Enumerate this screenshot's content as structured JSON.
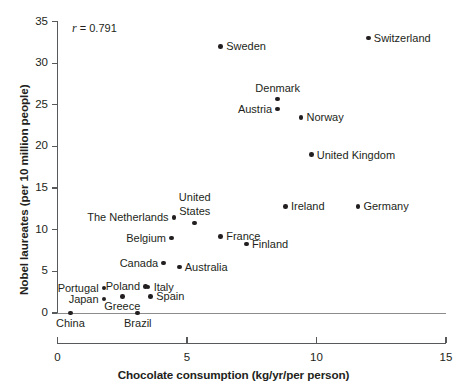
{
  "chart_data": {
    "type": "scatter",
    "title": "",
    "xlabel": "Chocolate consumption (kg/yr/per person)",
    "ylabel": "Nobel laureates (per 10 million people)",
    "xlim": [
      0,
      15
    ],
    "ylim": [
      0,
      35
    ],
    "xticks": [
      0,
      5,
      10,
      15
    ],
    "yticks": [
      0,
      5,
      10,
      15,
      20,
      25,
      30,
      35
    ],
    "xtick_labels": [
      "0",
      "5",
      "10",
      "15"
    ],
    "ytick_labels": [
      "0",
      "5",
      "10",
      "15",
      "20",
      "25",
      "30",
      "35"
    ],
    "grid": false,
    "legend": false,
    "annotations": [
      {
        "name": "correlation",
        "symbol": "r",
        "equals": " = ",
        "value": "0.791",
        "text": "r = 0.791"
      }
    ],
    "points": [
      {
        "label": "China",
        "x": 0.5,
        "y": 0.0,
        "pos": "below"
      },
      {
        "label": "Japan",
        "x": 1.8,
        "y": 1.7,
        "pos": "left"
      },
      {
        "label": "Portugal",
        "x": 1.8,
        "y": 3.0,
        "pos": "left"
      },
      {
        "label": "Greece",
        "x": 2.5,
        "y": 2.0,
        "pos": "below"
      },
      {
        "label": "Brazil",
        "x": 3.1,
        "y": 0.0,
        "pos": "below"
      },
      {
        "label": "Poland",
        "x": 3.4,
        "y": 3.2,
        "pos": "left"
      },
      {
        "label": "Italy",
        "x": 3.5,
        "y": 3.1,
        "pos": "right"
      },
      {
        "label": "Spain",
        "x": 3.6,
        "y": 2.0,
        "pos": "right"
      },
      {
        "label": "Canada",
        "x": 4.1,
        "y": 6.0,
        "pos": "left"
      },
      {
        "label": "Australia",
        "x": 4.7,
        "y": 5.5,
        "pos": "right"
      },
      {
        "label": "Belgium",
        "x": 4.4,
        "y": 9.0,
        "pos": "left"
      },
      {
        "label": "The Netherlands",
        "x": 4.5,
        "y": 11.5,
        "pos": "left"
      },
      {
        "label": "United States",
        "x": 5.3,
        "y": 10.8,
        "pos": "above"
      },
      {
        "label": "Sweden",
        "x": 6.3,
        "y": 32.0,
        "pos": "right"
      },
      {
        "label": "France",
        "x": 6.3,
        "y": 9.2,
        "pos": "right"
      },
      {
        "label": "Finland",
        "x": 7.3,
        "y": 8.3,
        "pos": "right"
      },
      {
        "label": "Austria",
        "x": 8.5,
        "y": 24.5,
        "pos": "left"
      },
      {
        "label": "Denmark",
        "x": 8.5,
        "y": 25.7,
        "pos": "above"
      },
      {
        "label": "Ireland",
        "x": 8.8,
        "y": 12.8,
        "pos": "right"
      },
      {
        "label": "Norway",
        "x": 9.4,
        "y": 23.5,
        "pos": "right"
      },
      {
        "label": "United Kingdom",
        "x": 9.8,
        "y": 19.0,
        "pos": "right"
      },
      {
        "label": "Germany",
        "x": 11.6,
        "y": 12.8,
        "pos": "right"
      },
      {
        "label": "Switzerland",
        "x": 12.0,
        "y": 33.0,
        "pos": "right"
      }
    ]
  },
  "colors": {
    "point": "#231f20",
    "axis": "#58595b",
    "text": "#231f20",
    "zero_rule": "#8c8c8c",
    "background": "#ffffff"
  }
}
